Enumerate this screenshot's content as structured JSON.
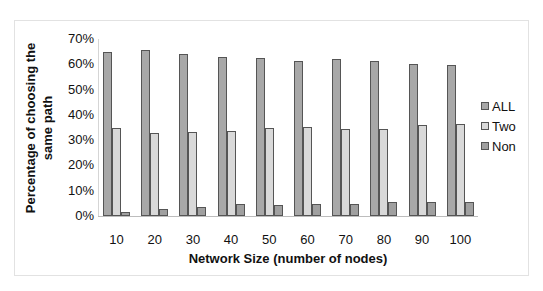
{
  "chart_data": {
    "type": "bar",
    "title": "",
    "xlabel": "Network Size (number of nodes)",
    "ylabel": "Percentage of choosing the same path",
    "ylabel_lines": [
      "Percentage of choosing the",
      "same path"
    ],
    "categories": [
      "10",
      "20",
      "30",
      "40",
      "50",
      "60",
      "70",
      "80",
      "90",
      "100"
    ],
    "series": [
      {
        "name": "ALL",
        "color": "#a8a8a8",
        "values": [
          64.7,
          65.5,
          63.9,
          63.0,
          62.3,
          61.3,
          62.1,
          61.4,
          60.3,
          59.8
        ]
      },
      {
        "name": "Two",
        "color": "#d9d9d9",
        "values": [
          34.8,
          32.7,
          33.3,
          33.7,
          34.7,
          35.1,
          34.4,
          34.4,
          36.0,
          36.2
        ]
      },
      {
        "name": "Non",
        "color": "#a0a0a0",
        "values": [
          1.6,
          2.9,
          3.4,
          4.7,
          4.5,
          4.7,
          4.7,
          5.6,
          5.4,
          5.6
        ]
      }
    ],
    "ylim": [
      0,
      70
    ],
    "yticks": [
      "0%",
      "10%",
      "20%",
      "30%",
      "40%",
      "50%",
      "60%",
      "70%"
    ],
    "grid": false,
    "legend_position": "right"
  }
}
